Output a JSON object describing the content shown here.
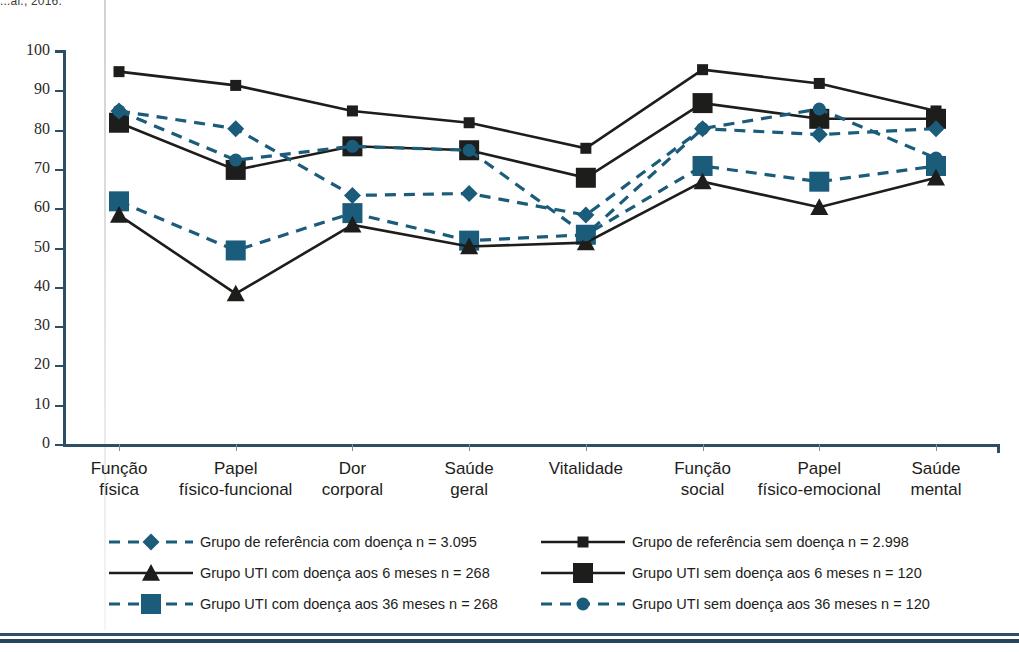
{
  "source_caption": "...al., 2016.",
  "colors": {
    "axis": "#2e4f63",
    "dark_series": "#1d1d1b",
    "blue_series": "#1a5c7a",
    "blue_dash": "#245d7c",
    "rule": "#2e5066"
  },
  "chart_data": {
    "type": "line",
    "title": "",
    "xlabel": "",
    "ylabel": "",
    "ylim": [
      0,
      100
    ],
    "ytick_step": 10,
    "grid": false,
    "legend_position": "bottom",
    "categories": [
      "Função\nfísica",
      "Papel\nfísico-funcional",
      "Dor\ncorporal",
      "Saúde\ngeral",
      "Vitalidade",
      "Função\nsocial",
      "Papel\nfísico-emocional",
      "Saúde\nmental"
    ],
    "ytick_labels": [
      "0",
      "10",
      "20",
      "30",
      "40",
      "50",
      "60",
      "70",
      "80",
      "90",
      "100"
    ],
    "series": [
      {
        "name": "Grupo de referência com doença n = 3.095",
        "key": "ref_com",
        "marker": "diamond",
        "line": "dashed",
        "color": "#1a5c7a",
        "values": [
          85,
          80.5,
          63.5,
          64,
          58.5,
          80.5,
          79,
          80.5
        ]
      },
      {
        "name": "Grupo de referência sem doença n = 2.998",
        "key": "ref_sem",
        "marker": "square-small",
        "line": "solid",
        "color": "#1d1d1b",
        "values": [
          95,
          91.5,
          85,
          82,
          75.5,
          95.5,
          92,
          85
        ]
      },
      {
        "name": "Grupo UTI com doença aos 6 meses n = 268",
        "key": "uti_com_6",
        "marker": "triangle",
        "line": "solid",
        "color": "#1d1d1b",
        "values": [
          58.5,
          38.5,
          56,
          50.5,
          51.5,
          67,
          60.5,
          68
        ]
      },
      {
        "name": "Grupo UTI sem doença aos 6 meses n = 120",
        "key": "uti_sem_6",
        "marker": "square-large",
        "line": "solid",
        "color": "#1d1d1b",
        "values": [
          82,
          70,
          76,
          75,
          68,
          87,
          83,
          83
        ]
      },
      {
        "name": "Grupo UTI com doença aos 36 meses n = 268",
        "key": "uti_com_36",
        "marker": "square-blue",
        "line": "dashed",
        "color": "#1a5c7a",
        "values": [
          62,
          49.5,
          59,
          52,
          53.5,
          71,
          67,
          71
        ]
      },
      {
        "name": "Grupo UTI sem doença aos 36 meses n = 120",
        "key": "uti_sem_36",
        "marker": "circle",
        "line": "dashed",
        "color": "#1a5c7a",
        "values": [
          85,
          72.5,
          76,
          75,
          53.5,
          80.5,
          85.5,
          73
        ]
      }
    ],
    "legend": [
      {
        "label": "Grupo de referência com doença n = 3.095",
        "marker": "diamond",
        "line": "dashed",
        "color": "#1a5c7a",
        "column": "left",
        "row": 0
      },
      {
        "label": "Grupo UTI com doença aos 6 meses n = 268",
        "marker": "triangle",
        "line": "solid",
        "color": "#1d1d1b",
        "column": "left",
        "row": 1
      },
      {
        "label": "Grupo UTI com doença aos 36 meses n = 268",
        "marker": "square-blue",
        "line": "dashed",
        "color": "#1a5c7a",
        "column": "left",
        "row": 2
      },
      {
        "label": "Grupo de referência sem doença n = 2.998",
        "marker": "square-small",
        "line": "solid",
        "color": "#1d1d1b",
        "column": "right",
        "row": 0
      },
      {
        "label": "Grupo UTI sem doença aos 6 meses n = 120",
        "marker": "square-large",
        "line": "solid",
        "color": "#1d1d1b",
        "column": "right",
        "row": 1
      },
      {
        "label": "Grupo UTI sem doença aos 36 meses n = 120",
        "marker": "circle",
        "line": "dashed",
        "color": "#1a5c7a",
        "column": "right",
        "row": 2
      }
    ]
  }
}
